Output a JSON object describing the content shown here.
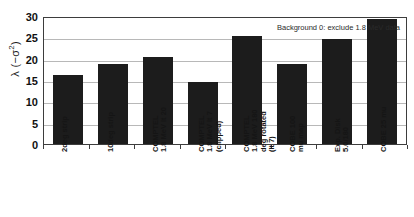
{
  "chart_data": {
    "type": "bar",
    "title": "",
    "subtitle": "",
    "xlabel": "",
    "ylabel": "λ (−σ²)",
    "ylabel_base": "λ (−σ",
    "ylabel_sup": "2",
    "ylabel_close": ")",
    "ylim": [
      0,
      30
    ],
    "ytick_step": 5,
    "yticks": [
      "0",
      "5",
      "10",
      "15",
      "20",
      "25",
      "30"
    ],
    "grid": true,
    "grid_axis": "y",
    "legend": null,
    "legend_position": "none",
    "bar_color": "#1c1c1c",
    "plot_background": "#ffffff",
    "gridline_color": "#b8b8b8",
    "axis_color": "#3d3d3d",
    "annotations": [
      {
        "text": "Background 0: exclude 1.8 MeV data",
        "position": "top-right",
        "note": "right portion overlapped by tallest bar"
      }
    ],
    "categories": [
      "2deg strip",
      "10deg strip",
      "COMPTEL\n1.8 MeV lt 20",
      "COMPTEL\n1.8 MeV lt 7\n(clipped)",
      "COMPTEL\n1.8 MeV 180\ndeg rotated\n(lt 7)",
      "COBE 100\nmu map",
      "Exp. Disk\n5.0/180",
      "COBE 25 mu"
    ],
    "values": [
      16.2,
      18.7,
      20.5,
      14.5,
      25.2,
      18.7,
      24.7,
      29.4
    ]
  }
}
